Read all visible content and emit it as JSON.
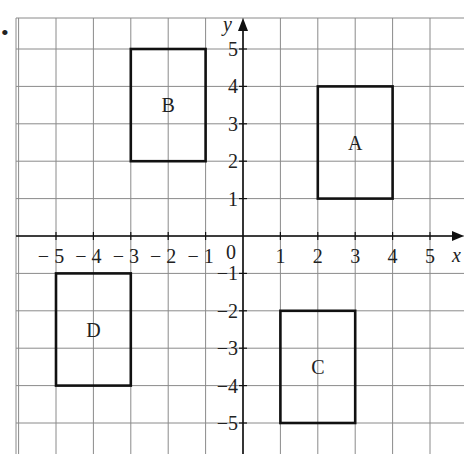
{
  "chart_data": {
    "type": "coordinate-grid",
    "title": "",
    "xlabel": "x",
    "ylabel": "y",
    "xlim": [
      -6,
      6
    ],
    "ylim": [
      -6,
      6
    ],
    "grid": true,
    "x_ticks": [
      "-5",
      "-4",
      "-3",
      "-2",
      "-1",
      "1",
      "2",
      "3",
      "4",
      "5"
    ],
    "y_ticks": [
      "5",
      "4",
      "3",
      "2",
      "1",
      "-1",
      "-2",
      "-3",
      "-4",
      "-5"
    ],
    "origin_label": "0",
    "shapes": [
      {
        "label": "A",
        "type": "rectangle",
        "x1": 2,
        "y1": 1,
        "x2": 4,
        "y2": 4
      },
      {
        "label": "B",
        "type": "rectangle",
        "x1": -3,
        "y1": 2,
        "x2": -1,
        "y2": 5
      },
      {
        "label": "C",
        "type": "rectangle",
        "x1": 1,
        "y1": -5,
        "x2": 3,
        "y2": -2
      },
      {
        "label": "D",
        "type": "rectangle",
        "x1": -5,
        "y1": -4,
        "x2": -3,
        "y2": -1
      }
    ]
  },
  "axes": {
    "x_label": "x",
    "y_label": "y",
    "origin": "0"
  },
  "labels": {
    "A": "A",
    "B": "B",
    "C": "C",
    "D": "D"
  },
  "bullet": "•"
}
